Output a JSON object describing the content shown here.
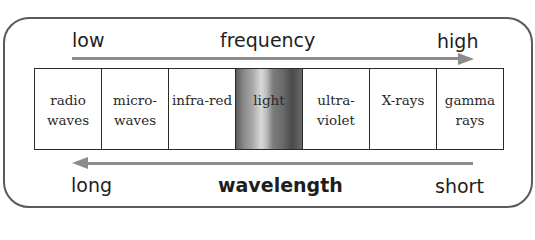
{
  "frequency_axis": {
    "low_label": "low",
    "title": "frequency",
    "high_label": "high",
    "arrow_direction": "right"
  },
  "spectrum": {
    "regions": [
      {
        "label": "radio\nwaves"
      },
      {
        "label": "micro-\nwaves"
      },
      {
        "label": "infra-red"
      },
      {
        "label": "light"
      },
      {
        "label": "ultra-\nviolet"
      },
      {
        "label": "X-rays"
      },
      {
        "label": "gamma\nrays"
      }
    ]
  },
  "wavelength_axis": {
    "long_label": "long",
    "title": "wavelength",
    "short_label": "short",
    "arrow_direction": "left"
  },
  "colors": {
    "arrow": "#8c8c8c",
    "frame_border": "#5a5a5a",
    "cell_border": "#2a2a2a",
    "text": "#1e1e1e"
  }
}
